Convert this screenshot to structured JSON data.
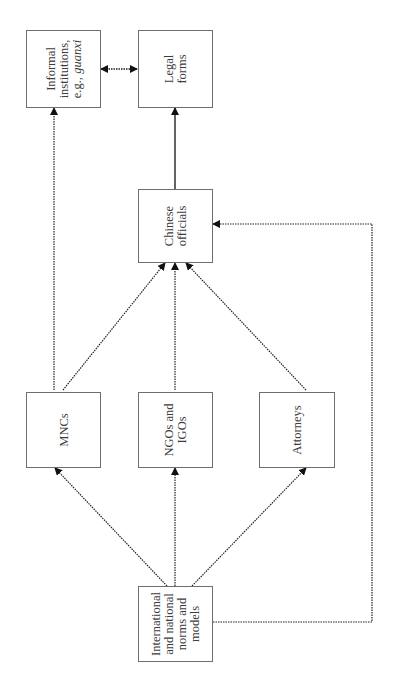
{
  "diagram": {
    "orientation": "rotated-90-ccw",
    "nodes": {
      "informal": {
        "lines": [
          "Informal",
          "institutions,",
          "e.g., "
        ],
        "italic": "guanxi"
      },
      "legal": {
        "lines": [
          "Legal",
          "forms"
        ]
      },
      "officials": {
        "lines": [
          "Chinese",
          "officials"
        ]
      },
      "mncs": {
        "lines": [
          "MNCs"
        ]
      },
      "ngos": {
        "lines": [
          "NGOs and",
          "IGOs"
        ]
      },
      "attorneys": {
        "lines": [
          "Attorneys"
        ]
      },
      "international": {
        "lines": [
          "International",
          "and national",
          "norms and",
          "models"
        ]
      }
    },
    "edges": [
      {
        "from": "international",
        "to": "mncs",
        "style": "dotted"
      },
      {
        "from": "international",
        "to": "ngos",
        "style": "dotted"
      },
      {
        "from": "international",
        "to": "attorneys",
        "style": "dotted"
      },
      {
        "from": "international",
        "to": "officials",
        "style": "dotted",
        "route": "right-loop"
      },
      {
        "from": "mncs",
        "to": "officials",
        "style": "dotted"
      },
      {
        "from": "ngos",
        "to": "officials",
        "style": "dotted"
      },
      {
        "from": "attorneys",
        "to": "officials",
        "style": "dotted"
      },
      {
        "from": "mncs",
        "to": "informal",
        "style": "dotted"
      },
      {
        "from": "officials",
        "to": "legal",
        "style": "solid"
      },
      {
        "from": "informal",
        "to": "legal",
        "style": "dotted",
        "bidirectional": true
      }
    ]
  }
}
